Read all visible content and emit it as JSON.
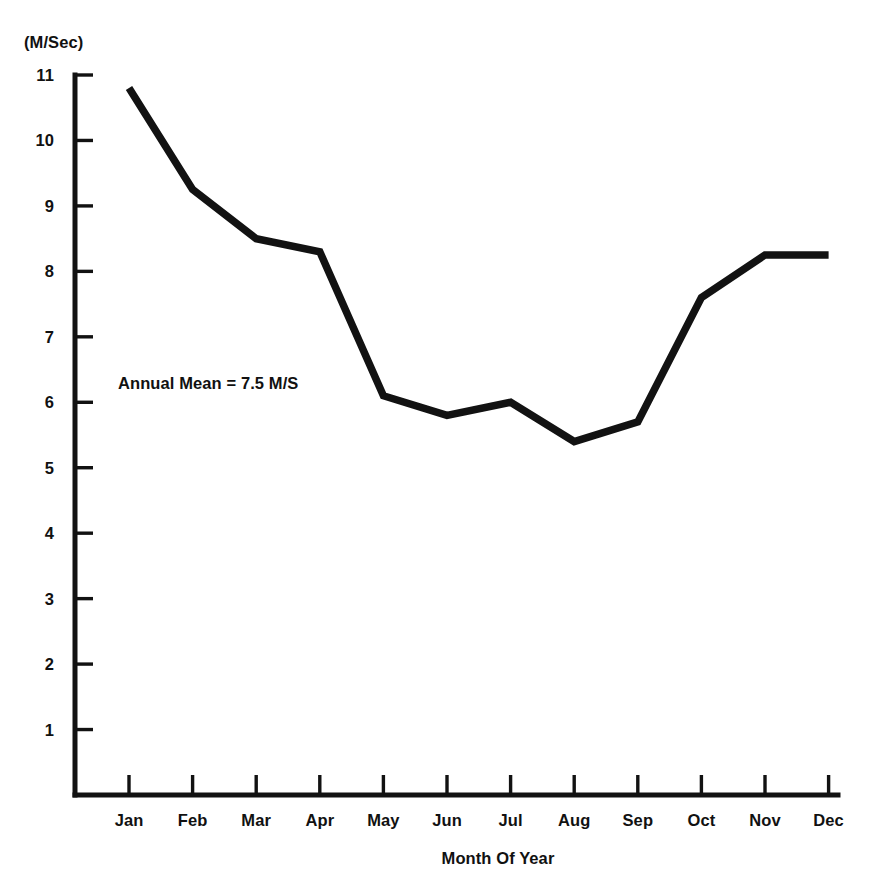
{
  "chart_data": {
    "type": "line",
    "title": "",
    "subtitle": "",
    "xlabel": "Month Of Year",
    "ylabel": "(M/Sec)",
    "categories": [
      "Jan",
      "Feb",
      "Mar",
      "Apr",
      "May",
      "Jun",
      "Jul",
      "Aug",
      "Sep",
      "Oct",
      "Nov",
      "Dec"
    ],
    "values": [
      10.8,
      9.25,
      8.5,
      8.3,
      6.1,
      5.8,
      6.0,
      5.4,
      5.7,
      7.6,
      8.25,
      8.25
    ],
    "series": [
      {
        "name": "Monthly mean wind speed",
        "values": [
          10.8,
          9.25,
          8.5,
          8.3,
          6.1,
          5.8,
          6.0,
          5.4,
          5.7,
          7.6,
          8.25,
          8.25
        ],
        "color": "#121212"
      }
    ],
    "ylim": [
      0,
      11
    ],
    "yticks": [
      1,
      2,
      3,
      4,
      5,
      6,
      7,
      8,
      9,
      10,
      11
    ],
    "ytick_labels": [
      "1",
      "2",
      "3",
      "4",
      "5",
      "6",
      "7",
      "8",
      "9",
      "10",
      "11"
    ],
    "xticks": [
      "Jan",
      "Feb",
      "Mar",
      "Apr",
      "May",
      "Jun",
      "Jul",
      "Aug",
      "Sep",
      "Oct",
      "Nov",
      "Dec"
    ],
    "grid": false,
    "legend": "none",
    "annotations": [
      {
        "text": "Annual Mean = 7.5 M/S",
        "x_category": "Jan",
        "y_value": 6.3
      }
    ]
  },
  "axes": {
    "y_unit_label": "(M/Sec)",
    "x_axis_title": "Month Of Year"
  },
  "annotation": {
    "annual_mean_text": "Annual Mean = 7.5 M/S"
  }
}
